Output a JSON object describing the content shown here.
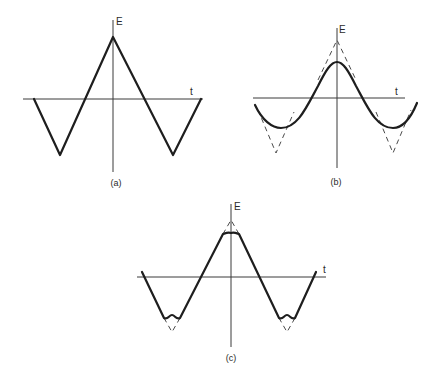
{
  "figure": {
    "background": "#ffffff",
    "ink_color": "#1e1e1e",
    "panels": [
      {
        "id": "a",
        "caption": "(a)",
        "caption_pos": [
          116,
          186
        ],
        "e_label": "E",
        "e_label_pos": [
          116,
          25
        ],
        "t_label": "t",
        "t_label_pos": [
          190,
          95
        ],
        "e_axis": {
          "x": 113,
          "y1": 20,
          "y2": 172
        },
        "t_axis": {
          "y": 99,
          "x1": 23,
          "x2": 203
        },
        "wave": "M34,99 L60,155 L113,37 L173,155 L201,99",
        "dashed": []
      },
      {
        "id": "b",
        "caption": "(b)",
        "caption_pos": [
          336,
          185
        ],
        "e_label": "E",
        "e_label_pos": [
          339,
          33
        ],
        "t_label": "t",
        "t_label_pos": [
          395,
          95
        ],
        "e_axis": {
          "x": 337,
          "y1": 28,
          "y2": 168
        },
        "t_axis": {
          "y": 98,
          "x1": 253,
          "x2": 405
        },
        "wave": "M255,105 C262,120 272,128 281,128 C298,128 307,106 318,86 C326,70 331,62 337,62 C343,62 348,70 356,86 C367,106 376,128 393,128 C402,128 410,120 417,103",
        "dashed": [
          "M258,110 L276,153 L294,112",
          "M318,80 L337,40 L356,80",
          "M376,112 L393,153 L411,110"
        ]
      },
      {
        "id": "c",
        "caption": "(c)",
        "caption_pos": [
          231,
          361
        ],
        "e_label": "E",
        "e_label_pos": [
          234,
          210
        ],
        "t_label": "t",
        "t_label_pos": [
          323,
          273
        ],
        "e_axis": {
          "x": 231,
          "y1": 204,
          "y2": 347
        },
        "t_axis": {
          "y": 277,
          "x1": 137,
          "x2": 326
        },
        "wave": "M142,272 L164,318 C168,320 169,315 172,315 C175,315 176,320 180,318 L223,234 C226,233 228,232 231,233 C234,232 236,233 239,234 L279,318 C283,320 284,315 287,315 C290,315 291,320 295,318 L316,272",
        "dashed": [
          "M164,318 L172,332 L180,318",
          "M223,234 L231,220 L239,234",
          "M279,318 L287,332 L295,318"
        ]
      }
    ]
  }
}
